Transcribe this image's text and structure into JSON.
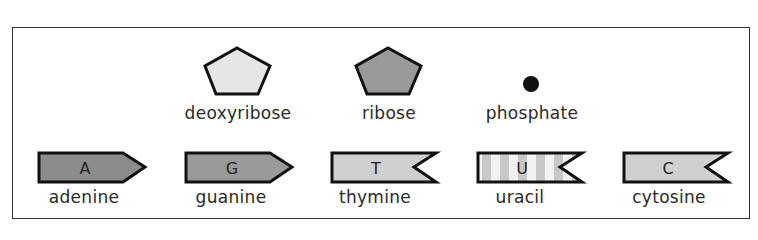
{
  "sugars": [
    {
      "name": "deoxyribose",
      "shape": "pentagon",
      "fill": "#e6e6e6"
    },
    {
      "name": "ribose",
      "shape": "pentagon",
      "fill": "#9a9a9a"
    }
  ],
  "phosphate": {
    "name": "phosphate",
    "shape": "dot",
    "fill": "#111111"
  },
  "bases": [
    {
      "letter": "A",
      "name": "adenine",
      "shape": "arrow-point",
      "fill": "#8c8c8c"
    },
    {
      "letter": "G",
      "name": "guanine",
      "shape": "arrow-point",
      "fill": "#9a9a9a"
    },
    {
      "letter": "T",
      "name": "thymine",
      "shape": "notch",
      "fill": "#d0d0d0"
    },
    {
      "letter": "U",
      "name": "uracil",
      "shape": "notch-striped",
      "fill": "#d4d4d4"
    },
    {
      "letter": "C",
      "name": "cytosine",
      "shape": "notch",
      "fill": "#d0d0d0"
    }
  ]
}
